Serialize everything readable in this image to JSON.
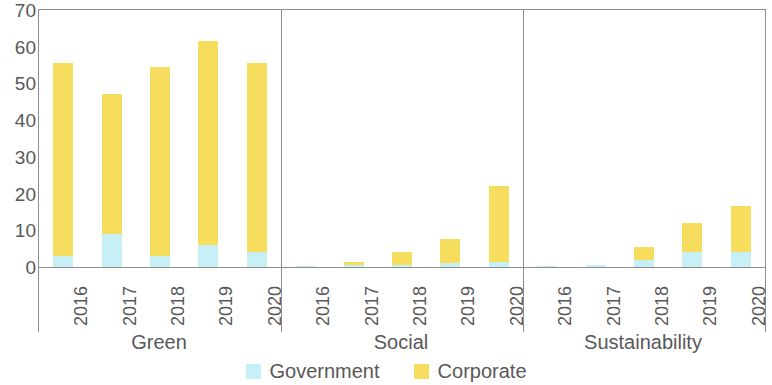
{
  "chart_data": {
    "type": "bar",
    "stacked": true,
    "title": "",
    "subtitle": "",
    "xlabel": "",
    "ylabel": "",
    "ylim": [
      0,
      70
    ],
    "ytick_labels": [
      "0",
      "10",
      "20",
      "30",
      "40",
      "50",
      "60",
      "70"
    ],
    "ytick_values": [
      0,
      10,
      20,
      30,
      40,
      50,
      60,
      70
    ],
    "grid": false,
    "legend_position": "bottom",
    "groups": [
      "Green",
      "Social",
      "Sustainability"
    ],
    "categories": [
      "2016",
      "2017",
      "2018",
      "2019",
      "2020"
    ],
    "series": [
      {
        "name": "Government",
        "color": "#c6f0f5",
        "values_by_group": {
          "Green": [
            3,
            9,
            3,
            6,
            4
          ],
          "Social": [
            0.3,
            0.5,
            0.5,
            1,
            1.5
          ],
          "Sustainability": [
            0.2,
            0.5,
            2,
            4,
            4
          ]
        }
      },
      {
        "name": "Corporate",
        "color": "#f6dd5e",
        "values_by_group": {
          "Green": [
            52.5,
            38,
            51.5,
            55.5,
            51.5
          ],
          "Social": [
            0,
            1,
            3.5,
            6.5,
            20.5
          ],
          "Sustainability": [
            0,
            0,
            3.5,
            8,
            12.5
          ]
        }
      }
    ],
    "totals_by_group": {
      "Green": [
        55.5,
        47,
        54.5,
        61.5,
        55.5
      ],
      "Social": [
        0.3,
        1.5,
        4,
        7.5,
        22
      ],
      "Sustainability": [
        0.2,
        0.5,
        5.5,
        12,
        16.5
      ]
    }
  },
  "legend": {
    "items": [
      {
        "label": "Government",
        "color": "#c6f0f5",
        "swatch_name": "legend-swatch-government"
      },
      {
        "label": "Corporate",
        "color": "#f6dd5e",
        "swatch_name": "legend-swatch-corporate"
      }
    ]
  },
  "axis": {
    "y_max": 70,
    "y_min": 0
  }
}
